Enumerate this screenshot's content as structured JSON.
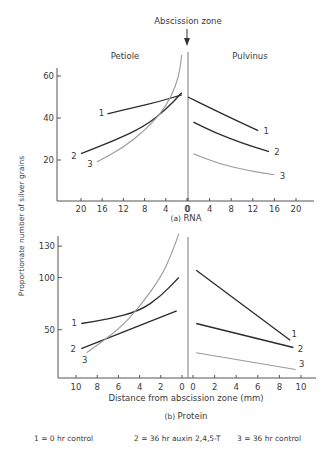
{
  "figure": {
    "top_annotation": "Abscission zone",
    "ylabel": "Proportionate number of silver grains",
    "legend": [
      {
        "id": "1",
        "text": "1 = 0 hr control"
      },
      {
        "id": "2",
        "text": "2 = 36 hr auxin 2,4,5-T"
      },
      {
        "id": "3",
        "text": "3 = 36 hr control"
      }
    ],
    "colors": {
      "series1": "#2b2b2b",
      "series2": "#2b2b2b",
      "series3": "#9a9a9a",
      "axis": "#555555"
    }
  },
  "chart_data": [
    {
      "type": "line",
      "panel": "(a)",
      "title": "RNA",
      "region_labels": [
        "Petiole",
        "Pulvinus"
      ],
      "xlabel": "",
      "ylabel": "Proportionate number of silver grains",
      "y_ticks": [
        20,
        40,
        60
      ],
      "ylim": [
        0,
        66
      ],
      "x_ticks_left": [
        "20",
        "16",
        "12",
        "8",
        "4",
        "0"
      ],
      "x_ticks_right": [
        "0",
        "4",
        "8",
        "12",
        "16",
        "20"
      ],
      "xlim_left": [
        24,
        0
      ],
      "xlim_right": [
        0,
        24
      ],
      "series": [
        {
          "name": "1",
          "label": "0 hr control",
          "petiole": {
            "x": [
              15,
              10,
              5,
              1
            ],
            "y": [
              42,
              45,
              48,
              51
            ]
          },
          "pulvinus": {
            "x": [
              0,
              4,
              8,
              13
            ],
            "y": [
              50,
              45,
              40,
              34
            ]
          }
        },
        {
          "name": "2",
          "label": "36 hr auxin 2,4,5-T",
          "petiole": {
            "x": [
              20,
              14,
              8,
              4,
              1
            ],
            "y": [
              23,
              29,
              36,
              44,
              52
            ]
          },
          "pulvinus": {
            "x": [
              1,
              5,
              10,
              15
            ],
            "y": [
              38,
              33,
              28,
              24
            ]
          }
        },
        {
          "name": "3",
          "label": "36 hr control",
          "petiole": {
            "x": [
              17,
              12,
              8,
              5,
              3,
              1.5,
              1
            ],
            "y": [
              19,
              26,
              34,
              42,
              50,
              60,
              70
            ]
          },
          "pulvinus": {
            "x": [
              1,
              6,
              11,
              16
            ],
            "y": [
              23,
              18,
              15,
              13
            ]
          }
        }
      ]
    },
    {
      "type": "line",
      "panel": "(b)",
      "title": "Protein",
      "xlabel": "Distance from abscission zone (mm)",
      "ylabel": "Proportionate number of silver grains",
      "y_ticks": [
        50,
        100,
        130
      ],
      "ylim": [
        0,
        140
      ],
      "x_ticks_left": [
        "10",
        "8",
        "6",
        "4",
        "2",
        "0"
      ],
      "x_ticks_right": [
        "0",
        "2",
        "4",
        "6",
        "8",
        "10"
      ],
      "xlim_left": [
        11,
        0
      ],
      "xlim_right": [
        0,
        11
      ],
      "series": [
        {
          "name": "1",
          "label": "0 hr control",
          "petiole": {
            "x": [
              9.5,
              7,
              4,
              2,
              0.3
            ],
            "y": [
              56,
              60,
              68,
              82,
              100
            ]
          },
          "pulvinus": {
            "x": [
              0.3,
              9
            ],
            "y": [
              107,
              40
            ]
          }
        },
        {
          "name": "2",
          "label": "36 hr auxin 2,4,5-T",
          "petiole": {
            "x": [
              9.5,
              0.5
            ],
            "y": [
              32,
              68
            ]
          },
          "pulvinus": {
            "x": [
              0.3,
              9.3
            ],
            "y": [
              56,
              33
            ]
          }
        },
        {
          "name": "3",
          "label": "36 hr control",
          "petiole": {
            "x": [
              9,
              6,
              4,
              2,
              1,
              0.3
            ],
            "y": [
              28,
              50,
              72,
              100,
              122,
              142
            ]
          },
          "pulvinus": {
            "x": [
              0.3,
              9.5
            ],
            "y": [
              28,
              12
            ]
          }
        }
      ]
    }
  ]
}
